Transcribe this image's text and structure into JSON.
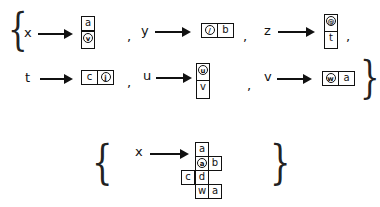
{
  "set1": {
    "open_brace": "{",
    "close_brace": "}",
    "mappings": [
      {
        "var": "x",
        "cells": [
          {
            "text": "a"
          },
          {
            "text": "v",
            "circled": true
          }
        ],
        "orientation": "vertical",
        "sep": ","
      },
      {
        "var": "y",
        "cells": [
          {
            "text": "/",
            "circled": true
          },
          {
            "text": "b"
          }
        ],
        "orientation": "horizontal",
        "sep": ","
      },
      {
        "var": "z",
        "cells": [
          {
            "text": "@",
            "circled": true
          },
          {
            "text": "t"
          }
        ],
        "orientation": "vertical",
        "sep": ","
      },
      {
        "var": "t",
        "cells": [
          {
            "text": "c"
          },
          {
            "text": "j",
            "circled": true
          }
        ],
        "orientation": "horizontal",
        "sep": ","
      },
      {
        "var": "u",
        "cells": [
          {
            "text": "u",
            "circled": true
          },
          {
            "text": "v"
          }
        ],
        "orientation": "vertical",
        "sep": ","
      },
      {
        "var": "v",
        "cells": [
          {
            "text": "w",
            "circled": true
          },
          {
            "text": "a"
          }
        ],
        "orientation": "horizontal",
        "sep": ""
      }
    ]
  },
  "set2": {
    "open_brace": "{",
    "close_brace": "}",
    "var": "x",
    "grid_cells": [
      {
        "text": "a",
        "col": 1,
        "row": 0
      },
      {
        "text": "a",
        "col": 1,
        "row": 1,
        "circled": true
      },
      {
        "text": "b",
        "col": 2,
        "row": 1
      },
      {
        "text": "c",
        "col": 0,
        "row": 2
      },
      {
        "text": "d",
        "col": 1,
        "row": 2
      },
      {
        "text": "w",
        "col": 1,
        "row": 3
      },
      {
        "text": "a",
        "col": 2,
        "row": 3
      }
    ]
  }
}
